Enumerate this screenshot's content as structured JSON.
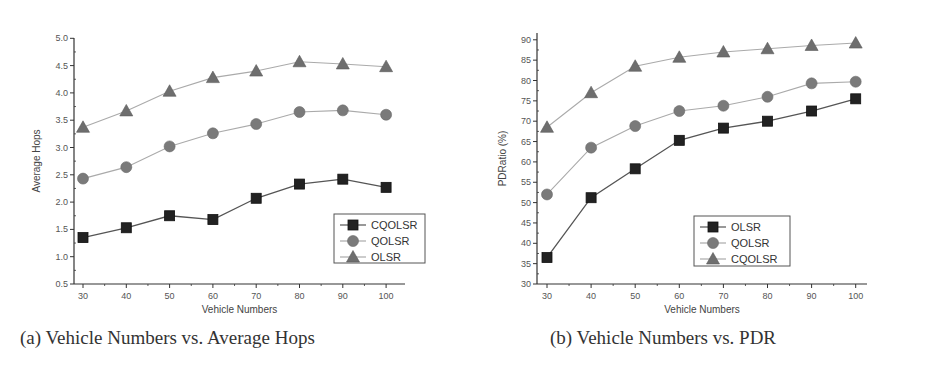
{
  "captions": {
    "a": "(a) Vehicle Numbers vs. Average Hops",
    "b": "(b) Vehicle Numbers vs. PDR"
  },
  "colors": {
    "axis": "#333333",
    "square": "#222222",
    "square_line": "#555555",
    "circle": "#7a7a7a",
    "circle_line": "#aaaaaa",
    "triangle": "#6e6e6e",
    "triangle_line": "#aaaaaa"
  },
  "chart_data": [
    {
      "type": "line",
      "title": "(a) Vehicle Numbers vs. Average Hops",
      "xlabel": "Vehicle Numbers",
      "ylabel": "Average Hops",
      "x": [
        30,
        40,
        50,
        60,
        70,
        80,
        90,
        100
      ],
      "xlim": [
        28,
        102
      ],
      "ylim": [
        0.5,
        5.0
      ],
      "yticks": [
        0.5,
        1.0,
        1.5,
        2.0,
        2.5,
        3.0,
        3.5,
        4.0,
        4.5,
        5.0
      ],
      "ytick_labels": [
        "0.5",
        "1.0",
        "1.5",
        "2.0",
        "2.5",
        "3.0",
        "3.5",
        "4.0",
        "4.5",
        "5.0"
      ],
      "grid": false,
      "legend_position": "lower right",
      "series": [
        {
          "name": "CQOLSR",
          "marker": "square",
          "values": [
            1.35,
            1.53,
            1.75,
            1.68,
            2.07,
            2.33,
            2.42,
            2.27
          ]
        },
        {
          "name": "QOLSR",
          "marker": "circle",
          "values": [
            2.43,
            2.64,
            3.02,
            3.26,
            3.43,
            3.65,
            3.68,
            3.6
          ]
        },
        {
          "name": "OLSR",
          "marker": "triangle",
          "values": [
            3.37,
            3.67,
            4.03,
            4.28,
            4.4,
            4.57,
            4.53,
            4.48
          ]
        }
      ]
    },
    {
      "type": "line",
      "title": "(b) Vehicle Numbers vs. PDR",
      "xlabel": "Vehicle Numbers",
      "ylabel": "PDRatio (%)",
      "x": [
        30,
        40,
        50,
        60,
        70,
        80,
        90,
        100
      ],
      "xlim": [
        28,
        102
      ],
      "ylim": [
        30,
        90
      ],
      "yticks": [
        30,
        35,
        40,
        45,
        50,
        55,
        60,
        65,
        70,
        75,
        80,
        85,
        90
      ],
      "ytick_labels": [
        "30",
        "35",
        "40",
        "45",
        "50",
        "55",
        "60",
        "65",
        "70",
        "75",
        "80",
        "85",
        "90"
      ],
      "grid": false,
      "legend_position": "lower right",
      "series": [
        {
          "name": "OLSR",
          "marker": "square",
          "values": [
            36.5,
            51.2,
            58.3,
            65.3,
            68.3,
            70.0,
            72.5,
            75.5
          ]
        },
        {
          "name": "QOLSR",
          "marker": "circle",
          "values": [
            52.0,
            63.5,
            68.8,
            72.5,
            73.8,
            76.0,
            79.3,
            79.7
          ]
        },
        {
          "name": "CQOLSR",
          "marker": "triangle",
          "values": [
            68.5,
            77.0,
            83.5,
            85.7,
            87.0,
            87.8,
            88.6,
            89.2
          ]
        }
      ]
    }
  ]
}
